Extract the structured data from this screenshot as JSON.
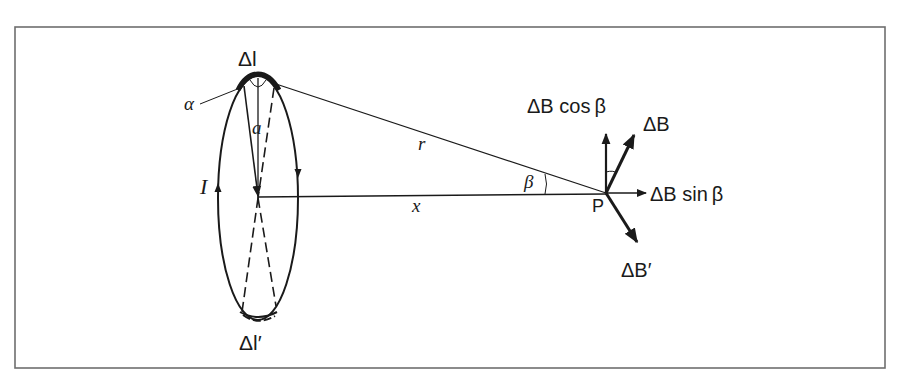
{
  "diagram": {
    "type": "physics-figure",
    "frame": {
      "stroke": "#6e6e6e"
    },
    "colors": {
      "ink": "#1a1a1a",
      "background": "#ffffff"
    },
    "labels": {
      "delta_l": "Δl",
      "delta_l_prime": "Δl′",
      "alpha": "α",
      "radius": "a",
      "current": "I",
      "distance_r": "r",
      "distance_x": "x",
      "angle_beta": "β",
      "point": "P",
      "delta_B": "ΔB",
      "delta_B_cos": "ΔB cos β",
      "delta_B_sin": "ΔB  sin β",
      "delta_B_prime": "ΔB′"
    },
    "elements": {
      "loop": {
        "shape": "ellipse",
        "description": "current loop seen in perspective"
      },
      "axis": {
        "description": "line x from loop center to point P"
      },
      "line_r": {
        "description": "line r from element Δl to point P"
      },
      "vectors": [
        "ΔB",
        "ΔB cos β",
        "ΔB sin β",
        "ΔB′"
      ]
    }
  }
}
